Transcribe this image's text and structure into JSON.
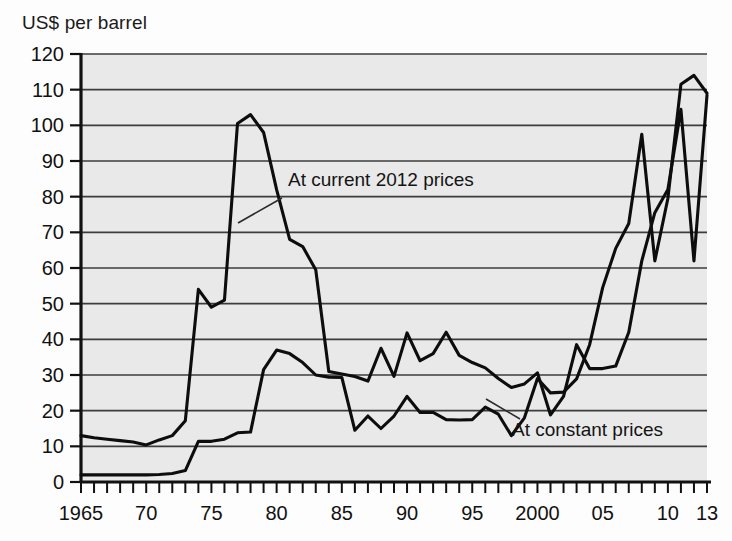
{
  "chart_data": {
    "type": "line",
    "title": "",
    "ylabel": "US$ per barrel",
    "xlabel": "",
    "ylim": [
      0,
      120
    ],
    "xlim": [
      1965,
      2013
    ],
    "ytick_step": 10,
    "yticks": [
      0,
      10,
      20,
      30,
      40,
      50,
      60,
      70,
      80,
      90,
      100,
      110,
      120
    ],
    "xticks_labeled": [
      {
        "value": 1965,
        "label": "1965"
      },
      {
        "value": 1970,
        "label": "70"
      },
      {
        "value": 1975,
        "label": "75"
      },
      {
        "value": 1980,
        "label": "80"
      },
      {
        "value": 1985,
        "label": "85"
      },
      {
        "value": 1990,
        "label": "90"
      },
      {
        "value": 1995,
        "label": "95"
      },
      {
        "value": 2000,
        "label": "2000"
      },
      {
        "value": 2005,
        "label": "05"
      },
      {
        "value": 2010,
        "label": "10"
      },
      {
        "value": 2013,
        "label": "13"
      }
    ],
    "grid": true,
    "grid_orientation": "horizontal",
    "legend_position": "inline-annotation",
    "x": [
      1965,
      1966,
      1967,
      1968,
      1969,
      1970,
      1971,
      1972,
      1973,
      1974,
      1975,
      1976,
      1977,
      1978,
      1979,
      1980,
      1981,
      1982,
      1983,
      1984,
      1985,
      1986,
      1987,
      1988,
      1989,
      1990,
      1991,
      1992,
      1993,
      1994,
      1995,
      1996,
      1997,
      1998,
      1999,
      2000,
      2001,
      2002,
      2003,
      2004,
      2005,
      2006,
      2007,
      2008,
      2009,
      2010,
      2011,
      2012,
      2013
    ],
    "series": [
      {
        "name": "At current 2012 prices",
        "annotation": "At current 2012 prices",
        "values": [
          13.0,
          12.4,
          12.0,
          11.6,
          11.2,
          10.4,
          11.8,
          13.0,
          17.2,
          54.0,
          49.0,
          51.0,
          100.5,
          103.0,
          98.0,
          82.0,
          68.0,
          66.0,
          59.5,
          31.0,
          30.3,
          29.6,
          28.3,
          37.5,
          29.6,
          41.8,
          34.0,
          36.0,
          42.0,
          35.5,
          33.5,
          32.0,
          29.0,
          26.5,
          27.5,
          30.6,
          18.8,
          24.0,
          38.5,
          31.8,
          31.8,
          32.5,
          42.0,
          62.0,
          75.5,
          82.0,
          104.5,
          62.0,
          108.5
        ]
      },
      {
        "name": "At constant prices",
        "annotation": "At constant prices",
        "values": [
          2.0,
          2.0,
          2.0,
          2.0,
          2.0,
          2.0,
          2.1,
          2.4,
          3.2,
          11.4,
          11.4,
          12.0,
          13.8,
          14.0,
          31.5,
          37.0,
          36.0,
          33.5,
          30.0,
          29.4,
          29.3,
          14.5,
          18.5,
          15.0,
          18.5,
          24.0,
          19.5,
          19.5,
          17.5,
          17.4,
          17.5,
          21.0,
          19.0,
          13.0,
          18.0,
          29.0,
          25.0,
          25.2,
          28.9,
          38.5,
          54.5,
          65.5,
          72.5,
          97.5,
          62.0,
          79.5,
          111.5,
          114.0,
          109.0
        ]
      }
    ],
    "annotations": [
      {
        "text": "At current 2012 prices",
        "target_x": 1978.5,
        "target_y": 77
      },
      {
        "text": "At constant prices",
        "target_x": 1999.0,
        "target_y": 28
      }
    ]
  },
  "colors": {
    "plot_background": "#e9e9e9",
    "page_background": "#fdfdfd",
    "line": "#0d0d0d",
    "gridline": "#3c3c3c",
    "axis": "#111111",
    "text": "#111111"
  }
}
